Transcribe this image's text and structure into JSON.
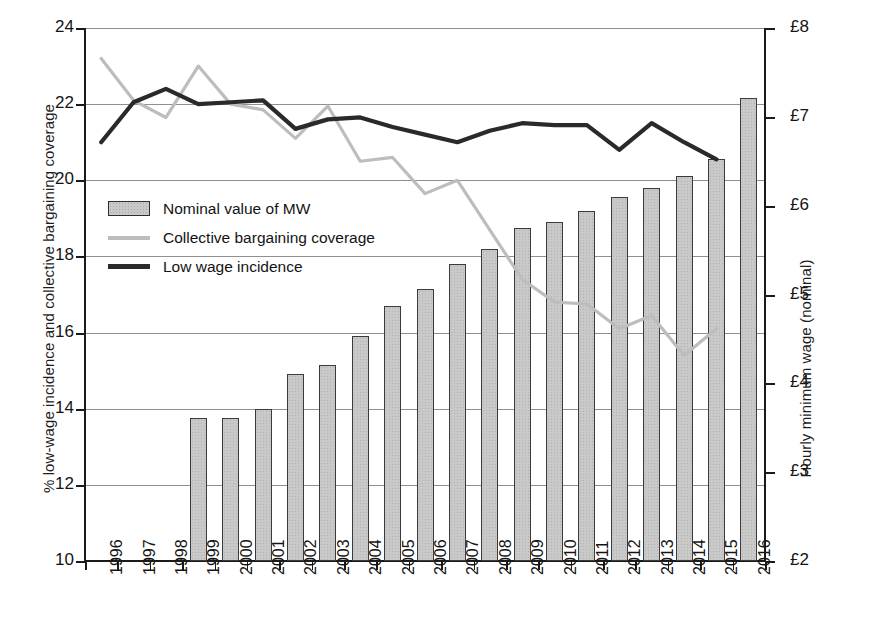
{
  "chart_data": {
    "type": "bar",
    "title": "",
    "subtitle": "",
    "xlabel": "",
    "ylabel": "% low-wage incidence and collective bargaining coverage",
    "y2label": "Hourly minimum wage (nominal)",
    "categories": [
      "1996",
      "1997",
      "1998",
      "1999",
      "2000",
      "2001",
      "2002",
      "2003",
      "2004",
      "2005",
      "2006",
      "2007",
      "2008",
      "2009",
      "2010",
      "2011",
      "2012",
      "2013",
      "2014",
      "2015",
      "2016"
    ],
    "ylim": [
      10,
      24
    ],
    "y2lim": [
      2,
      8
    ],
    "yticks": [
      "10",
      "12",
      "14",
      "16",
      "18",
      "20",
      "22",
      "24"
    ],
    "y2ticks": [
      "£2",
      "£3",
      "£4",
      "£5",
      "£6",
      "£7",
      "£8"
    ],
    "grid": true,
    "legend_position": "inside-left",
    "series": [
      {
        "name": "Nominal value of MW",
        "type": "bar",
        "axis": "right",
        "color": "#c9c9c9",
        "edge_color": "#3a3a3a",
        "values": [
          null,
          null,
          null,
          3.6,
          3.6,
          3.7,
          4.1,
          4.2,
          4.5,
          4.85,
          5.05,
          5.35,
          5.52,
          5.73,
          5.8,
          5.93,
          6.08,
          6.19,
          6.31,
          6.5,
          7.2
        ],
        "values_left_axis": [
          null,
          null,
          null,
          13.75,
          13.75,
          14.0,
          14.9,
          15.15,
          15.9,
          16.7,
          17.15,
          17.8,
          18.2,
          18.75,
          18.9,
          19.2,
          19.55,
          19.8,
          20.1,
          20.55,
          22.15
        ]
      },
      {
        "name": "Collective bargaining coverage",
        "type": "line",
        "axis": "left",
        "color": "#bdbdbd",
        "values": [
          23.2,
          22.1,
          21.65,
          23.0,
          22.0,
          21.85,
          21.1,
          21.95,
          20.5,
          20.6,
          19.65,
          20.0,
          18.7,
          17.4,
          16.8,
          16.75,
          16.1,
          16.45,
          15.4,
          16.1,
          null
        ]
      },
      {
        "name": "Low wage incidence",
        "type": "line",
        "axis": "left",
        "color": "#2a2a2a",
        "values": [
          21.0,
          22.05,
          22.4,
          22.0,
          22.05,
          22.1,
          21.35,
          21.6,
          21.65,
          21.4,
          21.2,
          21.0,
          21.3,
          21.5,
          21.45,
          21.45,
          20.8,
          21.5,
          21.0,
          20.55,
          null
        ]
      }
    ],
    "legend": [
      {
        "label": "Nominal value of MW",
        "swatch": "bar-swatch"
      },
      {
        "label": "Collective bargaining coverage",
        "swatch": "light-line-swatch"
      },
      {
        "label": "Low wage incidence",
        "swatch": "dark-line-swatch"
      }
    ]
  }
}
